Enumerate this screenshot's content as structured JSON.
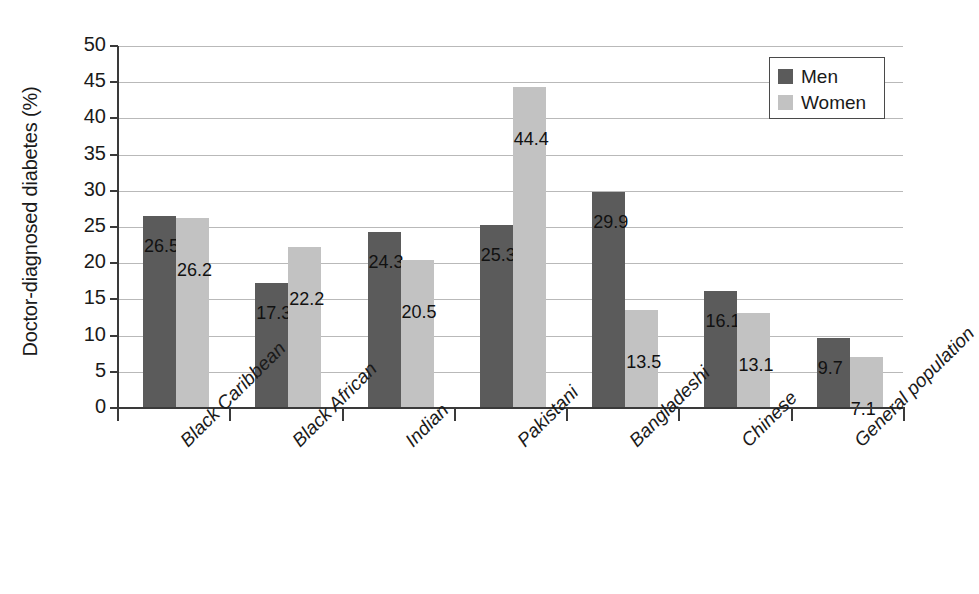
{
  "chart_data": {
    "type": "bar",
    "title": "",
    "xlabel": "",
    "ylabel": "Doctor-diagnosed diabetes (%)",
    "ylim": [
      0,
      50
    ],
    "ytick_labels": [
      "50",
      "45",
      "40",
      "35",
      "30",
      "25",
      "20",
      "15",
      "10",
      "5",
      "0"
    ],
    "ytick_values": [
      50,
      45,
      40,
      35,
      30,
      25,
      20,
      15,
      10,
      5,
      0
    ],
    "grid": true,
    "legend_position": "top-right",
    "categories": [
      "Black Caribbean",
      "Black African",
      "Indian",
      "Pakistani",
      "Bangladeshi",
      "Chinese",
      "General population"
    ],
    "series": [
      {
        "name": "Men",
        "color": "#5b5b5b",
        "values": [
          26.5,
          17.3,
          24.3,
          25.3,
          29.9,
          16.1,
          9.7
        ],
        "labels": [
          "26.5",
          "17.3",
          "24.3",
          "25.3",
          "29.9",
          "16.1",
          "9.7"
        ]
      },
      {
        "name": "Women",
        "color": "#c2c2c2",
        "values": [
          26.2,
          22.2,
          20.5,
          44.4,
          13.5,
          13.1,
          7.1
        ],
        "labels": [
          "26.2",
          "22.2",
          "20.5",
          "44.4",
          "13.5",
          "13.1",
          "7.1"
        ]
      }
    ]
  },
  "legend": {
    "items": [
      {
        "label": "Men",
        "swatch": "men"
      },
      {
        "label": "Women",
        "swatch": "women"
      }
    ]
  },
  "colors": {
    "men": "#5b5b5b",
    "women": "#c2c2c2",
    "gridline": "#b9b9b9",
    "axis": "#3a3a3a",
    "text": "#1a1a1a",
    "background": "#ffffff"
  }
}
